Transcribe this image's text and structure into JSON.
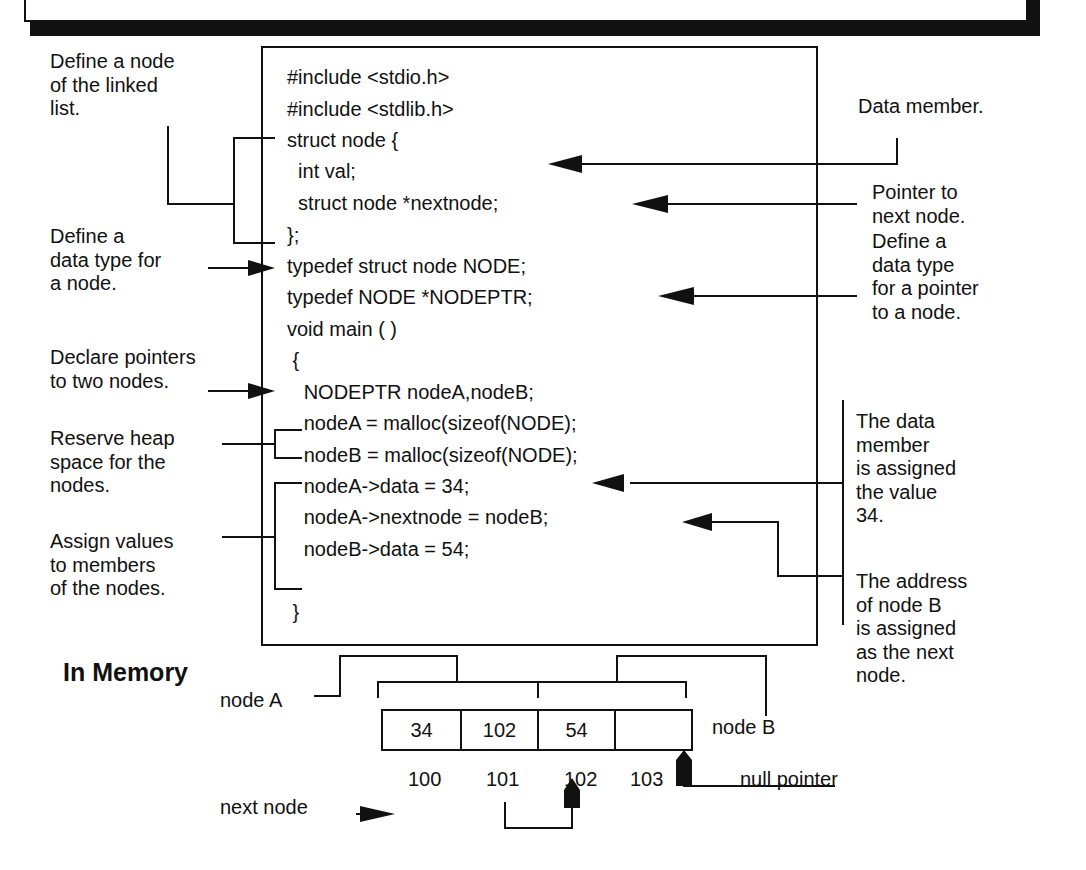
{
  "diagram": {
    "section_title": "In Memory",
    "code_lines": [
      "#include <stdio.h>",
      "#include <stdlib.h>",
      "struct node {",
      "  int val;",
      "  struct node *nextnode;",
      "};",
      "typedef struct node NODE;",
      "typedef NODE *NODEPTR;",
      "void main ( )",
      " {",
      "   NODEPTR nodeA,nodeB;",
      "   nodeA = malloc(sizeof(NODE);",
      "   nodeB = malloc(sizeof(NODE);",
      "   nodeA->data = 34;",
      "   nodeA->nextnode = nodeB;",
      "   nodeB->data = 54;",
      " }"
    ],
    "left_annotations": {
      "define_node": "Define a node\nof the linked\nlist.",
      "define_type": "Define a\ndata type for\na node.",
      "declare_pointers": "Declare pointers\nto two nodes.",
      "reserve_heap": "Reserve heap\nspace for the\nnodes.",
      "assign_values": "Assign values\nto members\nof the nodes."
    },
    "right_annotations": {
      "data_member": "Data member.",
      "pointer_next": "Pointer to\nnext node.",
      "define_ptr_type": "Define a\ndata type\nfor a pointer\nto a node.",
      "assigned_34": "The data\nmember\nis assigned\nthe value\n34.",
      "address_nodeB": "The address\nof node B\nis assigned\nas the next\nnode."
    },
    "memory": {
      "cells": [
        "34",
        "102",
        "54",
        ""
      ],
      "addresses": [
        "100",
        "101",
        "102",
        "103"
      ],
      "node_a_label": "node A",
      "node_b_label": "node B",
      "next_node_label": "next node",
      "null_pointer_label": "null pointer"
    }
  }
}
